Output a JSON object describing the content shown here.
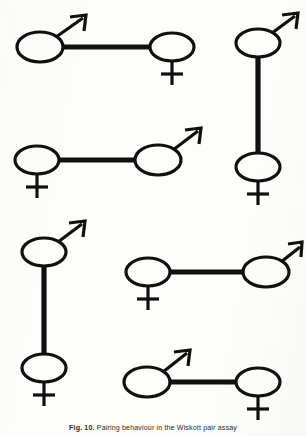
{
  "figure": {
    "background_color": "#fdfdfc",
    "ink_color": "#101010",
    "caption_label": "Fig. 10.",
    "caption_text": "Pairing behaviour in the Wiskott pair assay",
    "caption_full": "Fig. 10. Pairing behaviour in the Wiskott pair assay",
    "symbols": {
      "male_name": "male-symbol",
      "female_name": "female-symbol",
      "male_glyph": "♂",
      "female_glyph": "♀"
    },
    "pairs": [
      {
        "id": "pair-1",
        "orientation": "horizontal",
        "first_sex": "male",
        "second_sex": "female",
        "label": "male-left female-right horizontal pair"
      },
      {
        "id": "pair-2",
        "orientation": "vertical",
        "first_sex": "male",
        "second_sex": "female",
        "label": "male-top female-bottom vertical pair"
      },
      {
        "id": "pair-3",
        "orientation": "horizontal",
        "first_sex": "female",
        "second_sex": "male",
        "label": "female-left male-right horizontal pair"
      },
      {
        "id": "pair-4",
        "orientation": "vertical",
        "first_sex": "male",
        "second_sex": "female",
        "label": "male-top female-bottom vertical pair"
      },
      {
        "id": "pair-5",
        "orientation": "horizontal",
        "first_sex": "female",
        "second_sex": "male",
        "label": "female-left male-right horizontal pair"
      },
      {
        "id": "pair-6",
        "orientation": "horizontal",
        "first_sex": "male",
        "second_sex": "female",
        "label": "male-left female-right horizontal pair"
      }
    ]
  }
}
